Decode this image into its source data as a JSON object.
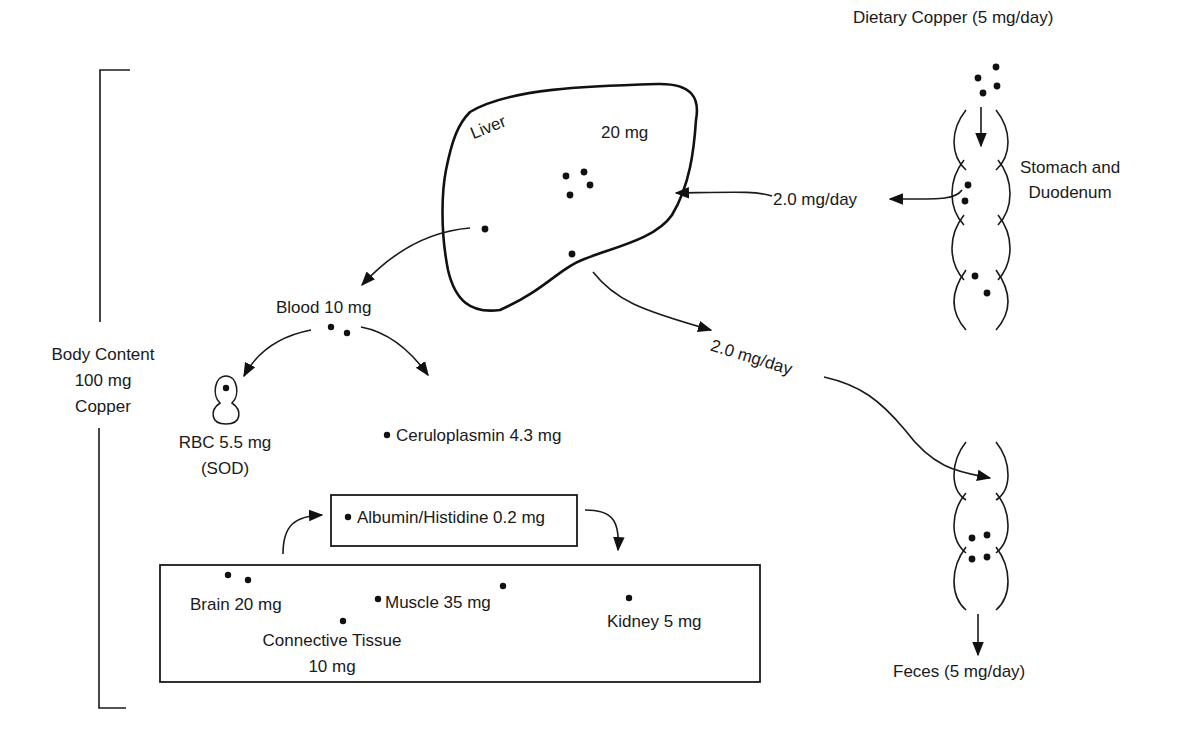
{
  "body_content": {
    "line1": "Body Content",
    "line2": "100 mg",
    "line3": "Copper"
  },
  "dietary": {
    "label": "Dietary Copper (5 mg/day)"
  },
  "gut": {
    "line1": "Stomach and",
    "line2": "Duodenum"
  },
  "liver": {
    "name": "Liver",
    "amount": "20 mg"
  },
  "flows": {
    "gut_to_liver": "2.0 mg/day",
    "liver_to_feces": "2.0 mg/day"
  },
  "blood": {
    "label": "Blood 10 mg"
  },
  "rbc": {
    "line1": "RBC 5.5 mg",
    "line2": "(SOD)"
  },
  "ceruloplasmin": {
    "label": "Ceruloplasmin 4.3 mg"
  },
  "albumin": {
    "label": "Albumin/Histidine 0.2 mg"
  },
  "tissues": {
    "brain": "Brain 20 mg",
    "connective_line1": "Connective Tissue",
    "connective_line2": "10 mg",
    "muscle": "Muscle 35 mg",
    "kidney": "Kidney 5 mg"
  },
  "feces": {
    "label": "Feces (5 mg/day)"
  },
  "colors": {
    "ink": "#1a1a1a",
    "background": "#ffffff"
  }
}
